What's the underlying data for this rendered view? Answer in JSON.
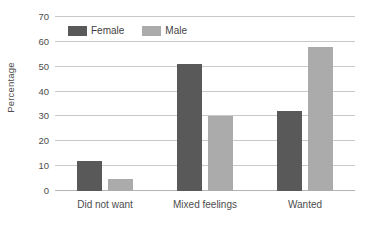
{
  "chart_data": {
    "type": "bar",
    "title": "",
    "subtitle": "",
    "xlabel": "",
    "ylabel": "Percentage",
    "categories": [
      "Did not want",
      "Mixed feelings",
      "Wanted"
    ],
    "series": [
      {
        "name": "Female",
        "color": "#595959",
        "values": [
          12,
          51,
          32
        ]
      },
      {
        "name": "Male",
        "color": "#ababab",
        "values": [
          5,
          30,
          58
        ]
      }
    ],
    "ylim": [
      0,
      70
    ],
    "y_ticks": [
      0,
      10,
      20,
      30,
      40,
      50,
      60,
      70
    ],
    "y_tick_labels": [
      "0",
      "10",
      "20",
      "30",
      "40",
      "50",
      "60",
      "70"
    ],
    "grid": true,
    "grid_axis": "y",
    "legend_position": "top-left-inside",
    "annotations": []
  },
  "legend": {
    "items": [
      {
        "label": "Female",
        "swatch": "legend-swatch-female"
      },
      {
        "label": "Male",
        "swatch": "legend-swatch-male"
      }
    ]
  },
  "axes": {
    "y_title": "Percentage"
  },
  "colors": {
    "female": "#595959",
    "male": "#ababab",
    "gridline": "#c9c9c9",
    "baseline": "#b4b4b4",
    "text": "#4d4d4d",
    "background": "#ffffff"
  }
}
